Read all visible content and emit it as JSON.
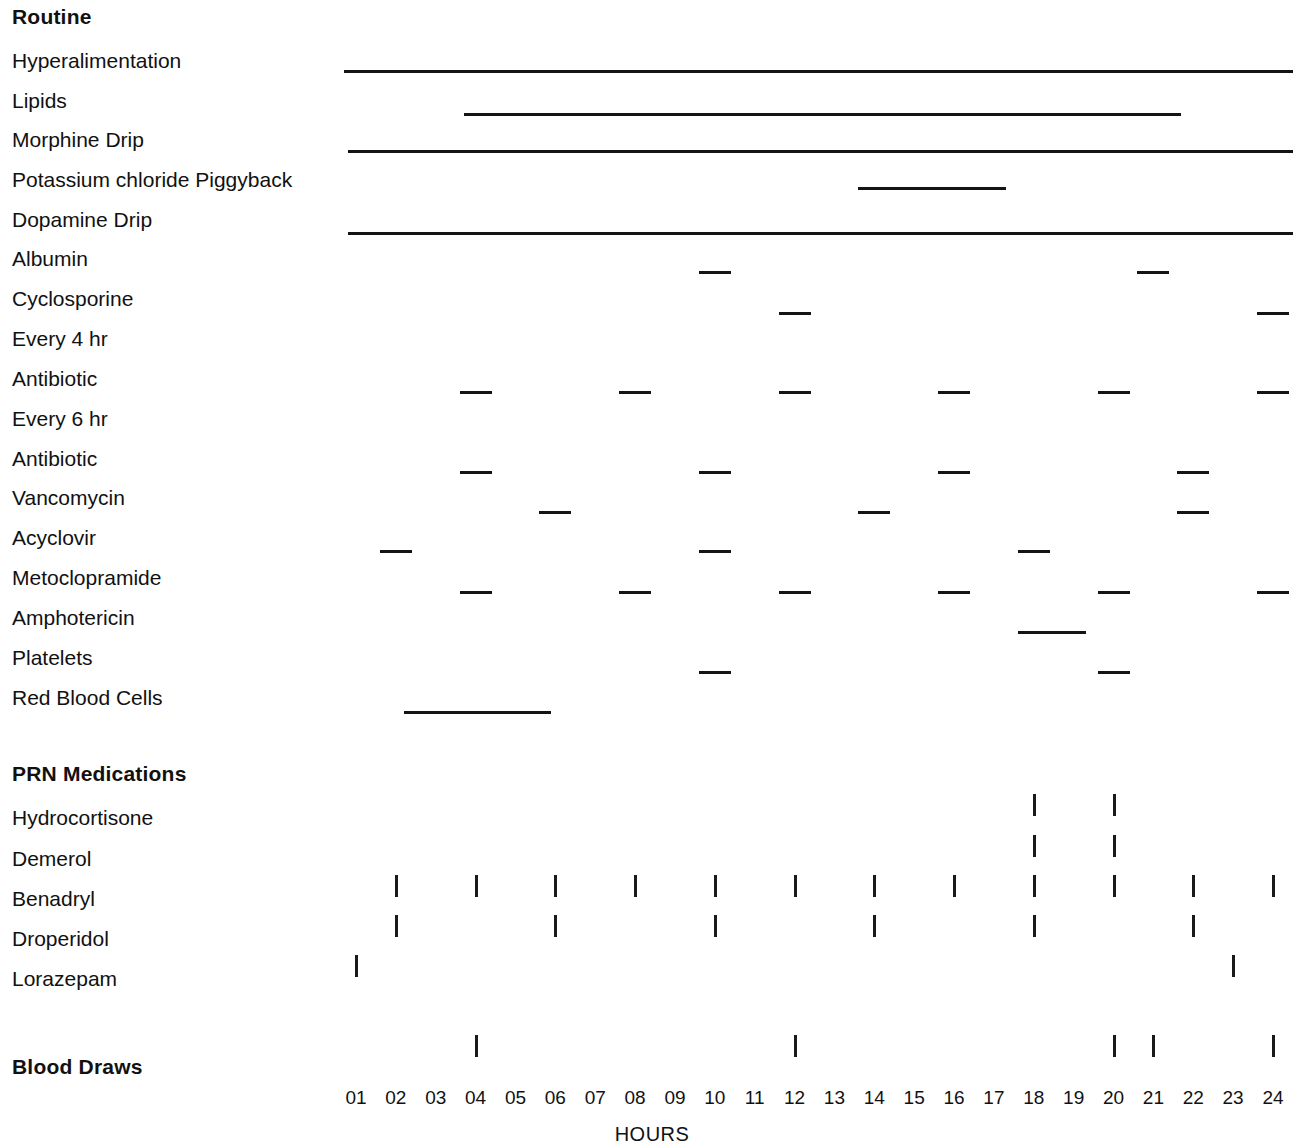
{
  "chart_data": {
    "type": "table",
    "title": "",
    "xlabel": "HOURS",
    "ylabel": "",
    "xlim": [
      1,
      24
    ],
    "x_tick_labels": [
      "01",
      "02",
      "03",
      "04",
      "05",
      "06",
      "07",
      "08",
      "09",
      "10",
      "11",
      "12",
      "13",
      "14",
      "15",
      "16",
      "17",
      "18",
      "19",
      "20",
      "21",
      "22",
      "23",
      "24"
    ],
    "grid": false,
    "legend": "none",
    "sections": [
      {
        "heading": "Routine",
        "rows": [
          {
            "label": "Hyperalimentation",
            "mark_type": "continuous",
            "intervals": [
              [
                0.7,
                24.5
              ]
            ]
          },
          {
            "label": "Lipids",
            "mark_type": "continuous",
            "intervals": [
              [
                3.7,
                21.7
              ]
            ]
          },
          {
            "label": "Morphine Drip",
            "mark_type": "continuous",
            "intervals": [
              [
                0.8,
                24.5
              ]
            ]
          },
          {
            "label": "Potassium chloride Piggyback",
            "mark_type": "continuous",
            "intervals": [
              [
                13.6,
                17.3
              ]
            ]
          },
          {
            "label": "Dopamine Drip",
            "mark_type": "continuous",
            "intervals": [
              [
                0.8,
                24.5
              ]
            ]
          },
          {
            "label": "Albumin",
            "mark_type": "dash",
            "hours": [
              10,
              21
            ]
          },
          {
            "label": "Cyclosporine",
            "mark_type": "dash",
            "hours": [
              12,
              24
            ]
          }
        ]
      },
      {
        "heading": "Every 4 hr",
        "is_subheading": true,
        "rows": [
          {
            "label": "Antibiotic",
            "mark_type": "dash",
            "hours": [
              4,
              8,
              12,
              16,
              20,
              24
            ]
          }
        ]
      },
      {
        "heading": "Every 6 hr",
        "is_subheading": true,
        "rows": [
          {
            "label": "Antibiotic",
            "mark_type": "dash",
            "hours": [
              4,
              10,
              16,
              22
            ]
          },
          {
            "label": "Vancomycin",
            "mark_type": "dash",
            "hours": [
              6,
              14,
              22
            ]
          },
          {
            "label": "Acyclovir",
            "mark_type": "dash",
            "hours": [
              2,
              10,
              18
            ]
          },
          {
            "label": "Metoclopramide",
            "mark_type": "dash",
            "hours": [
              4,
              8,
              12,
              16,
              20,
              24
            ]
          },
          {
            "label": "Amphotericin",
            "mark_type": "continuous",
            "intervals": [
              [
                17.6,
                19.3
              ]
            ]
          },
          {
            "label": "Platelets",
            "mark_type": "dash",
            "hours": [
              10,
              20
            ]
          },
          {
            "label": "Red Blood Cells",
            "mark_type": "continuous",
            "intervals": [
              [
                2.2,
                5.9
              ]
            ]
          }
        ]
      },
      {
        "heading": "PRN Medications",
        "rows": [
          {
            "label": "Hydrocortisone",
            "mark_type": "tick",
            "hours": [
              18,
              20
            ]
          },
          {
            "label": "Demerol",
            "mark_type": "tick",
            "hours": [
              18,
              20
            ]
          },
          {
            "label": "Benadryl",
            "mark_type": "tick",
            "hours": [
              2,
              4,
              6,
              8,
              10,
              12,
              14,
              16,
              18,
              20,
              22,
              24
            ]
          },
          {
            "label": "Droperidol",
            "mark_type": "tick",
            "hours": [
              2,
              6,
              10,
              14,
              18,
              22
            ]
          },
          {
            "label": "Lorazepam",
            "mark_type": "tick",
            "hours": [
              1,
              23
            ]
          }
        ]
      },
      {
        "heading": "Blood Draws",
        "heading_has_marks": true,
        "heading_mark_type": "tick",
        "heading_hours": [
          4,
          12,
          20,
          21,
          24
        ],
        "rows": []
      }
    ]
  },
  "labels": {
    "routine": "Routine",
    "hyperalimentation": "Hyperalimentation",
    "lipids": "Lipids",
    "morphine_drip": "Morphine Drip",
    "potassium_chloride_piggyback": "Potassium chloride Piggyback",
    "dopamine_drip": "Dopamine Drip",
    "albumin": "Albumin",
    "cyclosporine": "Cyclosporine",
    "every_4_hr": "Every 4 hr",
    "antibiotic_q4": "Antibiotic",
    "every_6_hr": "Every 6 hr",
    "antibiotic_q6": "Antibiotic",
    "vancomycin": "Vancomycin",
    "acyclovir": "Acyclovir",
    "metoclopramide": "Metoclopramide",
    "amphotericin": "Amphotericin",
    "platelets": "Platelets",
    "red_blood_cells": "Red Blood Cells",
    "prn_medications": "PRN Medications",
    "hydrocortisone": "Hydrocortisone",
    "demerol": "Demerol",
    "benadryl": "Benadryl",
    "droperidol": "Droperidol",
    "lorazepam": "Lorazepam",
    "blood_draws": "Blood Draws",
    "hours_axis": "HOURS"
  },
  "colors": {
    "ink": "#141414",
    "background": "#ffffff"
  }
}
